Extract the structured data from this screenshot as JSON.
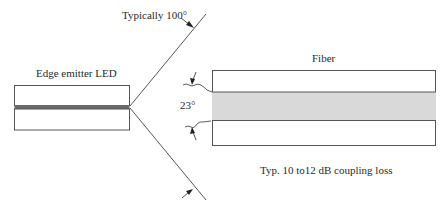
{
  "diagram": {
    "labels": {
      "led": "Edge emitter LED",
      "beam_angle": "Typically 100°",
      "fiber": "Fiber",
      "acceptance_angle": "23°",
      "coupling_loss": "Typ. 10 to12 dB coupling loss"
    },
    "colors": {
      "stroke": "#555555",
      "led_active_layer": "#6b6b6b",
      "fiber_core": "#d9d9d9",
      "background": "#ffffff",
      "text": "#2a2a2a"
    },
    "components": [
      {
        "id": "led",
        "type": "edge-emitter LED",
        "active_layer": true
      },
      {
        "id": "emission-cone",
        "type": "divergent beam",
        "angle": "100°"
      },
      {
        "id": "fiber",
        "type": "optical fiber",
        "parts": [
          "cladding-top",
          "core",
          "cladding-bottom"
        ],
        "acceptance_angle": "23°"
      }
    ]
  }
}
